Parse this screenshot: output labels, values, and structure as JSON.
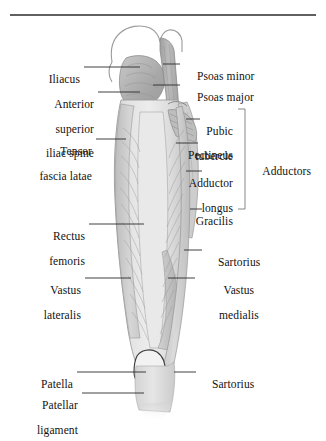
{
  "figure": {
    "title_rule": "horizontal-rule",
    "colors": {
      "ink": "#121212",
      "leader": "#2a2a2a",
      "muscle_light": "#dcdcdc",
      "muscle_mid": "#c2c2c2",
      "muscle_dark": "#a9a9a9",
      "outline": "#8d8d8d",
      "background": "#ffffff"
    }
  },
  "labels_left": [
    {
      "id": "iliacus",
      "text": "Iliacus",
      "lines": [
        "Iliacus"
      ]
    },
    {
      "id": "anterior-superior-iliac-spine",
      "text": "Anterior superior iliac spine",
      "lines": [
        "Anterior",
        "superior",
        "iliac spine"
      ]
    },
    {
      "id": "tensor-fascia-latae",
      "text": "Tensor fascia latae",
      "lines": [
        "Tensor",
        "fascia latae"
      ]
    },
    {
      "id": "rectus-femoris",
      "text": "Rectus femoris",
      "lines": [
        "Rectus",
        "femoris"
      ]
    },
    {
      "id": "vastus-lateralis",
      "text": "Vastus lateralis",
      "lines": [
        "Vastus",
        "lateralis"
      ]
    },
    {
      "id": "patella",
      "text": "Patella",
      "lines": [
        "Patella"
      ]
    },
    {
      "id": "patellar-ligament",
      "text": "Patellar ligament",
      "lines": [
        "Patellar",
        "ligament"
      ]
    }
  ],
  "labels_right": [
    {
      "id": "psoas-minor",
      "text": "Psoas minor",
      "lines": [
        "Psoas minor"
      ]
    },
    {
      "id": "psoas-major",
      "text": "Psoas major",
      "lines": [
        "Psoas major"
      ]
    },
    {
      "id": "pubic-tubercle",
      "text": "Pubic tubercle",
      "lines": [
        "Pubic",
        "tubercle"
      ]
    },
    {
      "id": "pectineus",
      "text": "Pectineus",
      "lines": [
        "Pectineus"
      ]
    },
    {
      "id": "adductor-longus",
      "text": "Adductor longus",
      "lines": [
        "Adductor",
        "longus"
      ]
    },
    {
      "id": "gracilis",
      "text": "Gracilis",
      "lines": [
        "Gracilis"
      ]
    },
    {
      "id": "sartorius-upper",
      "text": "Sartorius",
      "lines": [
        "Sartorius"
      ]
    },
    {
      "id": "vastus-medialis",
      "text": "Vastus medialis",
      "lines": [
        "Vastus",
        "medialis"
      ]
    },
    {
      "id": "sartorius-lower",
      "text": "Sartorius",
      "lines": [
        "Sartorius"
      ]
    }
  ],
  "bracket": {
    "id": "adductors-bracket",
    "label": "Adductors",
    "groups": [
      "Pubic tubercle",
      "Pectineus",
      "Adductor longus",
      "Gracilis"
    ]
  },
  "text": {
    "iliacus": "Iliacus",
    "anterior_1": "Anterior",
    "anterior_2": "superior",
    "anterior_3": "iliac spine",
    "tensor_1": "Tensor",
    "tensor_2": "fascia latae",
    "rectus_1": "Rectus",
    "rectus_2": "femoris",
    "vastus_lat_1": "Vastus",
    "vastus_lat_2": "lateralis",
    "patella": "Patella",
    "patellar_lig_1": "Patellar",
    "patellar_lig_2": "ligament",
    "psoas_minor": "Psoas minor",
    "psoas_major": "Psoas major",
    "pubic_1": "Pubic",
    "pubic_2": "tubercle",
    "pectineus": "Pectineus",
    "adductor_1": "Adductor",
    "adductor_2": "longus",
    "gracilis": "Gracilis",
    "sartorius_upper": "Sartorius",
    "vastus_med_1": "Vastus",
    "vastus_med_2": "medialis",
    "sartorius_lower": "Sartorius",
    "adductors": "Adductors"
  }
}
